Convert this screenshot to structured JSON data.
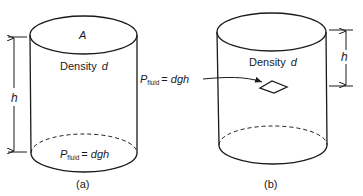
{
  "figure": {
    "panels": [
      {
        "id": "a",
        "caption": "(a)",
        "top_label": "A",
        "density_label": "Density",
        "density_symbol": "d",
        "height_symbol": "h",
        "pressure_P": "P",
        "pressure_sub": "fluid",
        "pressure_eq": "= ",
        "pressure_expr": "dgh"
      },
      {
        "id": "b",
        "caption": "(b)",
        "density_label": "Density",
        "density_symbol": "d",
        "height_symbol": "h",
        "pressure_P": "P",
        "pressure_sub": "fluid",
        "pressure_eq": "= ",
        "pressure_expr": "dgh"
      }
    ],
    "colors": {
      "stroke": "#1a1a1a",
      "background": "#ffffff"
    }
  }
}
